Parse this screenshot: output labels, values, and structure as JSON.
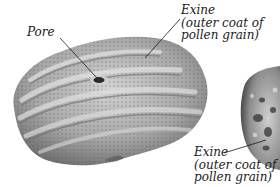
{
  "figure": {
    "left_grain": {
      "name": "pollen grain (ridged, with pore)",
      "labels": {
        "pore": "Pore",
        "exine_line1": "Exine",
        "exine_line2": "(outer coat of",
        "exine_line3": "pollen grain)"
      }
    },
    "right_grain": {
      "name": "pollen grain (partially visible, spiny/reticulate)",
      "labels": {
        "exine_line1": "Exine",
        "exine_line2": "(outer coat of",
        "exine_line3": "pollen grain)"
      }
    },
    "colors": {
      "background": "#ffffff",
      "grain_light": "#c9c9c9",
      "grain_mid": "#9a9a9a",
      "grain_dark": "#5e5e5e",
      "leader_line": "#1a1a1a",
      "text": "#1a1a1a"
    }
  }
}
